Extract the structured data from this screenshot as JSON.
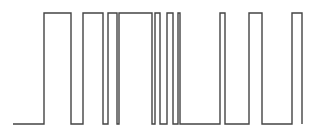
{
  "diagram": {
    "type": "digital-square-waveform",
    "stroke_color": "#444444",
    "stroke_width": 1.4,
    "background": "#ffffff",
    "levels": {
      "high_y": 13,
      "low_y": 124
    },
    "start_x": 13,
    "end_x": 302,
    "segments": [
      {
        "state": "low",
        "from": 13,
        "to": 44
      },
      {
        "state": "high",
        "from": 44,
        "to": 71
      },
      {
        "state": "low",
        "from": 71,
        "to": 83
      },
      {
        "state": "high",
        "from": 83,
        "to": 103
      },
      {
        "state": "low",
        "from": 103,
        "to": 108
      },
      {
        "state": "high",
        "from": 108,
        "to": 117
      },
      {
        "state": "low",
        "from": 117,
        "to": 119
      },
      {
        "state": "high",
        "from": 119,
        "to": 152
      },
      {
        "state": "low",
        "from": 152,
        "to": 155
      },
      {
        "state": "high",
        "from": 155,
        "to": 160
      },
      {
        "state": "low",
        "from": 160,
        "to": 167
      },
      {
        "state": "high",
        "from": 167,
        "to": 173
      },
      {
        "state": "low",
        "from": 173,
        "to": 178
      },
      {
        "state": "high",
        "from": 178,
        "to": 180
      },
      {
        "state": "low",
        "from": 180,
        "to": 220
      },
      {
        "state": "high",
        "from": 220,
        "to": 225
      },
      {
        "state": "low",
        "from": 225,
        "to": 249
      },
      {
        "state": "high",
        "from": 249,
        "to": 262
      },
      {
        "state": "low",
        "from": 262,
        "to": 292
      },
      {
        "state": "high",
        "from": 292,
        "to": 302
      }
    ],
    "final_drop_to": "low"
  }
}
